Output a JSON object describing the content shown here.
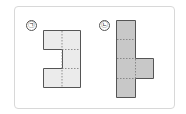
{
  "figure": {
    "labels": [
      "㉠",
      "㉡"
    ],
    "shape_a": {
      "fill": "#ebebeb",
      "stroke": "#555555",
      "description": "net of 5 squares forming a C shape"
    },
    "shape_b": {
      "fill": "#c8c8c8",
      "stroke": "#555555",
      "description": "net of 5 squares: column of 4 with one tab on right"
    }
  }
}
